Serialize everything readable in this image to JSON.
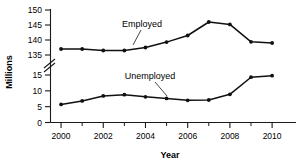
{
  "chart_data": {
    "type": "line",
    "title": "",
    "xlabel": "Year",
    "ylabel": "Millions",
    "x": [
      2000,
      2001,
      2002,
      2003,
      2004,
      2005,
      2006,
      2007,
      2008,
      2009,
      2010
    ],
    "xlim": [
      1999.5,
      2010.8
    ],
    "xticks_major": [
      2000,
      2002,
      2004,
      2006,
      2008,
      2010
    ],
    "xticks_minor": [
      2001,
      2003,
      2005,
      2007,
      2009
    ],
    "xtick_labels": [
      "2000",
      "2002",
      "2004",
      "2006",
      "2008",
      "2010"
    ],
    "yticks": [
      0,
      5,
      10,
      15,
      135,
      140,
      145,
      150
    ],
    "ytick_labels": [
      "0",
      "5",
      "10",
      "15",
      "135",
      "140",
      "145",
      "150"
    ],
    "y_axis_break": {
      "present": true,
      "lower": 15,
      "upper": 135,
      "symbol": "double-slash"
    },
    "ylim_lower_segment": [
      0,
      15
    ],
    "ylim_upper_segment": [
      135,
      150
    ],
    "grid": false,
    "legend_position": "inline-annotations",
    "series": [
      {
        "name": "Employed",
        "label": "Employed",
        "color": "#111111",
        "marker": "filled-circle",
        "values": [
          137.0,
          137.0,
          136.5,
          136.5,
          137.5,
          139.3,
          141.5,
          146.0,
          145.2,
          139.4,
          139.0
        ]
      },
      {
        "name": "Unemployed",
        "label": "Unemployed",
        "color": "#111111",
        "marker": "filled-circle",
        "values": [
          5.7,
          6.8,
          8.4,
          8.8,
          8.1,
          7.6,
          7.0,
          7.1,
          8.9,
          14.3,
          14.8
        ]
      }
    ],
    "annotations": [
      {
        "text": "Employed",
        "series": "Employed",
        "points_to_year": 2005
      },
      {
        "text": "Unemployed",
        "series": "Unemployed",
        "points_to_year": 2007
      }
    ]
  }
}
